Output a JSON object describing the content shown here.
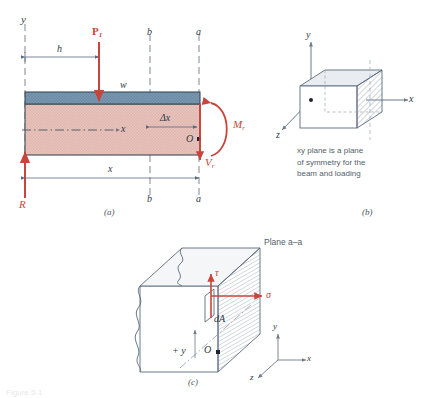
{
  "figure": {
    "title_tag": "Figure 5-1",
    "panels": [
      {
        "id": "a",
        "caption": "(a)",
        "labels": {
          "y_axis": "y",
          "load_P1": "P",
          "load_P1_sub": "1",
          "dim_h": "h",
          "dist_load_w": "w",
          "section_b_top": "b",
          "section_b_bottom": "b",
          "section_a_top": "a",
          "section_a_bottom": "a",
          "neutral_axis_x": "x",
          "delta_x": "Δx",
          "moment_M": "M",
          "moment_M_sub": "r",
          "shear_V": "V",
          "shear_V_sub": "r",
          "origin_O": "O",
          "reaction_R": "R",
          "dim_x": "x"
        }
      },
      {
        "id": "b",
        "caption": "(b)",
        "labels": {
          "axis_y": "y",
          "axis_x": "x",
          "axis_z": "z"
        },
        "note_lines": [
          "xy plane is a plane",
          "of symmetry for the",
          "beam and loading"
        ]
      },
      {
        "id": "c",
        "caption": "(c)",
        "labels": {
          "plane_aa": "Plane a–a",
          "shear_stress_tau": "τ",
          "normal_stress_sigma": "σ",
          "area_dA": "dA",
          "plus_y": "+ y",
          "origin_O": "O",
          "axis_y": "y",
          "axis_x": "x",
          "axis_z": "z"
        }
      }
    ]
  },
  "colors": {
    "beam_flange_blue": "#6b8aa5",
    "beam_web_pink": "#e0b6ae",
    "force_red": "#c9443b",
    "line_blue_gray": "#5a6b7d",
    "outline_dark": "#3c4a57",
    "hatch_gray": "#7a8794"
  }
}
